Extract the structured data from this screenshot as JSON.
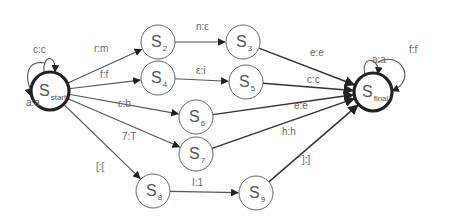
{
  "diagram": {
    "type": "finite-state-transducer",
    "nodes": [
      {
        "id": "start",
        "base": "S",
        "sub": "start",
        "x": 50,
        "y": 91,
        "r": 19,
        "terminal": true
      },
      {
        "id": "s2",
        "base": "S",
        "sub": "2",
        "x": 158,
        "y": 42,
        "r": 17,
        "terminal": false
      },
      {
        "id": "s3",
        "base": "S",
        "sub": "3",
        "x": 243,
        "y": 42,
        "r": 17,
        "terminal": false
      },
      {
        "id": "s4",
        "base": "S",
        "sub": "4",
        "x": 158,
        "y": 78,
        "r": 17,
        "terminal": false
      },
      {
        "id": "s5",
        "base": "S",
        "sub": "5",
        "x": 246,
        "y": 82,
        "r": 17,
        "terminal": false
      },
      {
        "id": "s6",
        "base": "S",
        "sub": "6",
        "x": 196,
        "y": 117,
        "r": 17,
        "terminal": false
      },
      {
        "id": "s7",
        "base": "S",
        "sub": "7",
        "x": 196,
        "y": 154,
        "r": 17,
        "terminal": false
      },
      {
        "id": "s8",
        "base": "S",
        "sub": "8",
        "x": 153,
        "y": 191,
        "r": 17,
        "terminal": false
      },
      {
        "id": "s9",
        "base": "S",
        "sub": "9",
        "x": 256,
        "y": 193,
        "r": 17,
        "terminal": false
      },
      {
        "id": "final",
        "base": "S",
        "sub": "final",
        "x": 373,
        "y": 92,
        "r": 19,
        "terminal": true
      }
    ],
    "edges": [
      {
        "from": "start",
        "to": "s2",
        "label": "r:m",
        "lx": 94,
        "ly": 52
      },
      {
        "from": "start",
        "to": "s4",
        "label": "f:f",
        "lx": 100,
        "ly": 78
      },
      {
        "from": "start",
        "to": "s6",
        "label": "ε:b",
        "lx": 118,
        "ly": 107
      },
      {
        "from": "start",
        "to": "s7",
        "label": "7:T",
        "lx": 122,
        "ly": 140
      },
      {
        "from": "start",
        "to": "s8",
        "label": "[:[",
        "lx": 96,
        "ly": 170
      },
      {
        "from": "s2",
        "to": "s3",
        "label": "n:ε",
        "lx": 196,
        "ly": 30
      },
      {
        "from": "s4",
        "to": "s5",
        "label": "ε:i",
        "lx": 196,
        "ly": 74
      },
      {
        "from": "s8",
        "to": "s9",
        "label": "I:1",
        "lx": 192,
        "ly": 186
      },
      {
        "from": "s3",
        "to": "final",
        "label": "e:e",
        "lx": 310,
        "ly": 56
      },
      {
        "from": "s5",
        "to": "final",
        "label": "c:c",
        "lx": 307,
        "ly": 83
      },
      {
        "from": "s6",
        "to": "final",
        "label": "e:e",
        "lx": 294,
        "ly": 109
      },
      {
        "from": "s7",
        "to": "final",
        "label": "h:h",
        "lx": 282,
        "ly": 135
      },
      {
        "from": "s9",
        "to": "final",
        "label": "]:]",
        "lx": 302,
        "ly": 163
      }
    ],
    "self_loops": [
      {
        "node": "start",
        "label": "c:c",
        "lx": 33,
        "ly": 53
      },
      {
        "node": "start",
        "label": "a:a",
        "lx": 26,
        "ly": 106
      },
      {
        "node": "final",
        "label": "a:a",
        "lx": 372,
        "ly": 63
      },
      {
        "node": "final",
        "label": "f:f",
        "lx": 409,
        "ly": 53
      }
    ]
  }
}
